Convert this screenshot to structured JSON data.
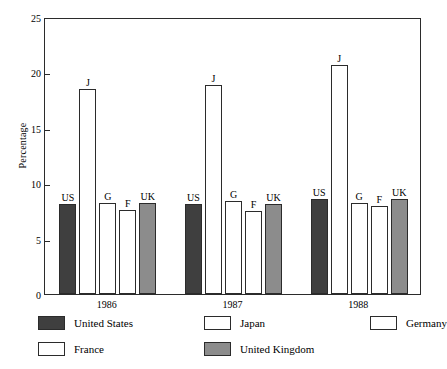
{
  "chart_data": {
    "type": "bar",
    "title": "",
    "subtitle": "",
    "xlabel": "",
    "ylabel": "Percentage",
    "categories": [
      "1986",
      "1987",
      "1988"
    ],
    "ylim": [
      0,
      25
    ],
    "yticks": [
      0,
      5,
      10,
      15,
      20,
      25
    ],
    "ytick_labels": [
      "0",
      "5",
      "10",
      "15",
      "20",
      "25"
    ],
    "grid": false,
    "legend_position": "below-axes",
    "bar_point_labels": [
      "US",
      "J",
      "G",
      "F",
      "UK"
    ],
    "series": [
      {
        "name": "United States",
        "short": "US",
        "color": "#3f3f3f",
        "values": [
          8.1,
          8.1,
          8.6
        ]
      },
      {
        "name": "Japan",
        "short": "J",
        "color": "#ffffff",
        "values": [
          18.5,
          18.9,
          20.7
        ]
      },
      {
        "name": "Germany",
        "short": "G",
        "color": "#ffffff",
        "values": [
          8.2,
          8.4,
          8.2
        ]
      },
      {
        "name": "France",
        "short": "F",
        "color": "#ffffff",
        "values": [
          7.6,
          7.5,
          7.9
        ]
      },
      {
        "name": "United Kingdom",
        "short": "UK",
        "color": "#8c8c8c",
        "values": [
          8.2,
          8.1,
          8.6
        ]
      }
    ]
  },
  "axes": {
    "y_title": "Percentage",
    "ytick_0": "0",
    "ytick_1": "5",
    "ytick_2": "10",
    "ytick_3": "15",
    "ytick_4": "20",
    "ytick_5": "25",
    "xtick_0": "1986",
    "xtick_1": "1987",
    "xtick_2": "1988"
  },
  "legend": {
    "items": [
      {
        "label": "United States",
        "color": "#3f3f3f"
      },
      {
        "label": "Japan",
        "color": "#ffffff"
      },
      {
        "label": "Germany",
        "color": "#ffffff"
      },
      {
        "label": "France",
        "color": "#ffffff"
      },
      {
        "label": "United Kingdom",
        "color": "#8c8c8c"
      }
    ]
  },
  "colors": {
    "axis": "#2b2b2b",
    "background": "#ffffff",
    "united_states": "#3f3f3f",
    "japan": "#ffffff",
    "germany": "#ffffff",
    "france": "#ffffff",
    "united_kingdom": "#8c8c8c"
  }
}
